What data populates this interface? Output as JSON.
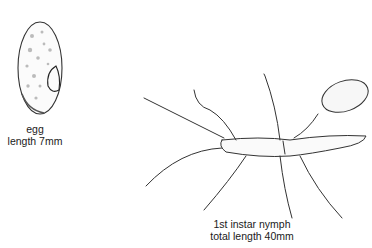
{
  "egg": {
    "caption_line1": "egg",
    "caption_line2": "length 7mm"
  },
  "nymph": {
    "caption_line1": "1st instar nymph",
    "caption_line2": "total length 40mm"
  },
  "colors": {
    "ink": "#2a2a2a",
    "background": "#ffffff"
  }
}
